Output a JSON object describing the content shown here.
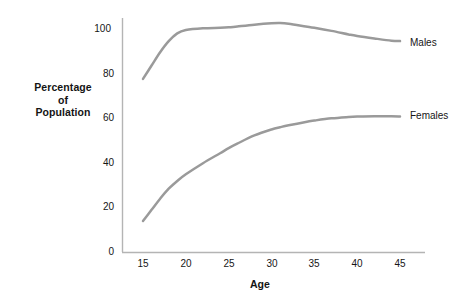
{
  "chart_data": {
    "type": "line",
    "title": "",
    "xlabel": "Age",
    "ylabel": "Percentage of Population",
    "ylabel_lines": [
      "Percentage",
      "of",
      "Population"
    ],
    "xlim": [
      15,
      45
    ],
    "ylim": [
      0,
      105
    ],
    "grid": false,
    "legend_position": "right-of-line-end",
    "x_ticks": [
      "15",
      "20",
      "25",
      "30",
      "35",
      "40",
      "45"
    ],
    "y_ticks": [
      "0",
      "20",
      "40",
      "60",
      "80",
      "100"
    ],
    "x": [
      15,
      16,
      17,
      18,
      19,
      20,
      22,
      24,
      25,
      26,
      28,
      30,
      31,
      32,
      34,
      35,
      37,
      39,
      40,
      42,
      44,
      45
    ],
    "series": [
      {
        "name": "Males",
        "color": "#9a9a9a",
        "values": [
          78,
          84,
          90,
          95,
          98.5,
          100,
          100.8,
          101,
          101.2,
          101.6,
          102.4,
          103,
          103.1,
          102.8,
          101.6,
          101,
          99.6,
          98,
          97.3,
          96.2,
          95.2,
          95
        ]
      },
      {
        "name": "Females",
        "color": "#9a9a9a",
        "values": [
          14,
          19,
          24,
          28.5,
          32,
          35,
          40,
          44.5,
          46.8,
          48.8,
          52.5,
          55.2,
          56.2,
          57.1,
          58.6,
          59.2,
          60.2,
          60.8,
          61,
          61.2,
          61.1,
          61
        ]
      }
    ]
  },
  "axis": {
    "line_color": "#b4b4b4"
  }
}
